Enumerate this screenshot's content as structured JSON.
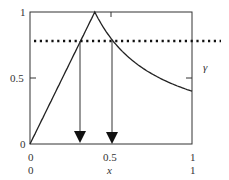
{
  "chart_data": {
    "type": "line",
    "title": "",
    "xlabel": "x",
    "ylabel": "",
    "xlim": [
      0,
      1
    ],
    "ylim": [
      0,
      1
    ],
    "x_ticks": [
      "0",
      "0.5",
      "1"
    ],
    "x_ticks_secondary": [
      "0",
      "1"
    ],
    "y_ticks": [
      "0",
      "0.5",
      "1"
    ],
    "right_label": "γ",
    "grid": false,
    "series": [
      {
        "name": "curve",
        "style": "solid",
        "x": [
          0,
          0.1,
          0.2,
          0.3,
          0.4,
          0.5,
          0.6,
          0.7,
          0.8,
          0.9,
          1.0
        ],
        "y": [
          0,
          0.25,
          0.5,
          0.75,
          1.0,
          0.8,
          0.67,
          0.57,
          0.5,
          0.44,
          0.4
        ]
      },
      {
        "name": "threshold",
        "style": "dotted",
        "x": [
          0,
          1.15
        ],
        "y": [
          0.78,
          0.78
        ]
      }
    ],
    "annotations": [
      {
        "type": "arrow-down",
        "x": 0.31,
        "from_y": 0.78,
        "to_y": 0
      },
      {
        "type": "arrow-down",
        "x": 0.51,
        "from_y": 0.78,
        "to_y": 0
      }
    ]
  },
  "labels": {
    "y0": "0",
    "y05": "0.5",
    "y1": "1",
    "x0": "0",
    "x05": "0.5",
    "x1": "1",
    "x0b": "0",
    "xname": "x",
    "x1b": "1",
    "gamma": "γ"
  }
}
